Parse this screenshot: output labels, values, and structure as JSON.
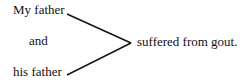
{
  "diagram": {
    "subject_top": "My father",
    "conjunction": "and",
    "subject_bottom": "his father",
    "predicate": "suffered from gout.",
    "line_color": "#111111"
  }
}
